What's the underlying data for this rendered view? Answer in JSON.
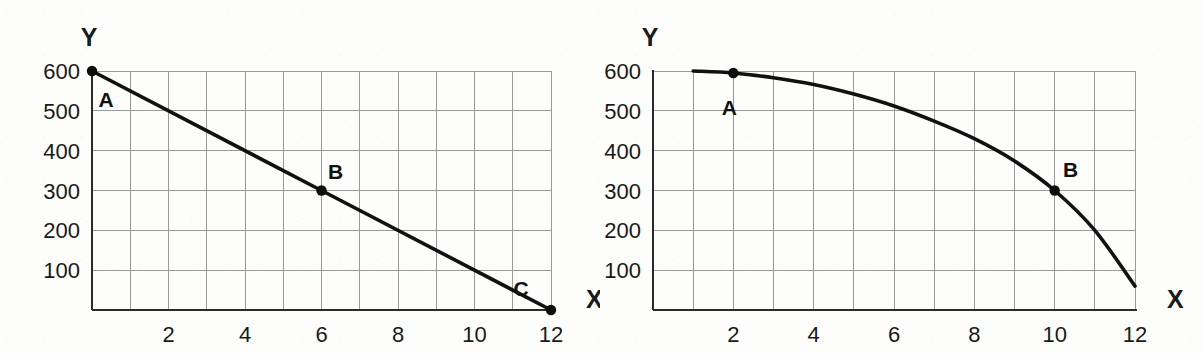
{
  "figure": {
    "background_color": "#fdfdfc",
    "ink_color": "#111111",
    "grid_color": "#9a9a9a",
    "panel_count": 2
  },
  "chart_data": [
    {
      "id": "left",
      "type": "line",
      "title": "",
      "xlabel": "X",
      "ylabel": "Y",
      "xlim": [
        0,
        12
      ],
      "ylim": [
        0,
        600
      ],
      "grid": true,
      "grid_x_step": 1,
      "grid_y_step": 100,
      "legend": "none",
      "x_ticks": [
        2,
        4,
        6,
        8,
        10,
        12
      ],
      "x_tick_labels": [
        "2",
        "4",
        "6",
        "8",
        "10",
        "12"
      ],
      "y_ticks": [
        100,
        200,
        300,
        400,
        500,
        600
      ],
      "y_tick_labels": [
        "100",
        "200",
        "300",
        "400",
        "500",
        "600"
      ],
      "series": [
        {
          "name": "straight line",
          "x": [
            0,
            6,
            12
          ],
          "values": [
            600,
            300,
            0
          ]
        }
      ],
      "annotations": [
        {
          "label": "A",
          "x": 0,
          "y": 600,
          "marker": true,
          "label_dx": 14,
          "label_dy": 36
        },
        {
          "label": "B",
          "x": 6,
          "y": 300,
          "marker": true,
          "label_dx": 14,
          "label_dy": -12
        },
        {
          "label": "C",
          "x": 12,
          "y": 0,
          "marker": true,
          "label_dx": -30,
          "label_dy": -14
        }
      ],
      "axis_label_positions": {
        "y_title_x": 0,
        "y_title_y": 660,
        "x_title_x": 12.6,
        "x_title_y": 20
      }
    },
    {
      "id": "right",
      "type": "line",
      "title": "",
      "xlabel": "X",
      "ylabel": "Y",
      "xlim": [
        0,
        12
      ],
      "ylim": [
        0,
        600
      ],
      "grid": true,
      "grid_x_step": 1,
      "grid_y_step": 100,
      "legend": "none",
      "x_ticks": [
        2,
        4,
        6,
        8,
        10,
        12
      ],
      "x_tick_labels": [
        "2",
        "4",
        "6",
        "8",
        "10",
        "12"
      ],
      "y_ticks": [
        100,
        200,
        300,
        400,
        500,
        600
      ],
      "y_tick_labels": [
        "100",
        "200",
        "300",
        "400",
        "500",
        "600"
      ],
      "series": [
        {
          "name": "concave curve",
          "x": [
            1,
            2,
            3,
            4,
            5,
            6,
            7,
            8,
            9,
            10,
            11,
            12
          ],
          "values": [
            600,
            595,
            583,
            566,
            542,
            512,
            474,
            430,
            374,
            300,
            200,
            60
          ]
        }
      ],
      "annotations": [
        {
          "label": "A",
          "x": 2,
          "y": 595,
          "marker": true,
          "label_dx": -4,
          "label_dy": 42
        },
        {
          "label": "B",
          "x": 10,
          "y": 300,
          "marker": true,
          "label_dx": 16,
          "label_dy": -14
        }
      ],
      "axis_label_positions": {
        "y_title_x": 0,
        "y_title_y": 660,
        "x_title_x": 12.5,
        "x_title_y": 22
      }
    }
  ]
}
